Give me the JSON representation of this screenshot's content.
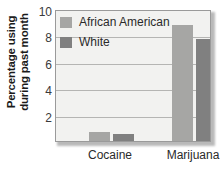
{
  "chart_data": {
    "type": "bar",
    "title": "",
    "xlabel": "",
    "ylabel": "Percentage using during past month",
    "ylabel_line1": "Percentage using",
    "ylabel_line2": "during past month",
    "categories": [
      "Cocaine",
      "Marijuana"
    ],
    "series": [
      {
        "name": "African American",
        "color": "#a6a6a4",
        "values": [
          0.7,
          8.8
        ]
      },
      {
        "name": "White",
        "color": "#808080",
        "values": [
          0.5,
          7.7
        ]
      }
    ],
    "ylim": [
      0,
      10
    ],
    "yticks": [
      2,
      4,
      6,
      8,
      10
    ],
    "ytick_labels": [
      "2",
      "4",
      "6",
      "8",
      "10"
    ],
    "grid": true,
    "grid_axis": "y",
    "legend_position": "top-left-inside",
    "plot_background": "#f2f2f0",
    "plot_border_color": "#9a9a9a",
    "gridline_color": "#b5b5b3"
  }
}
